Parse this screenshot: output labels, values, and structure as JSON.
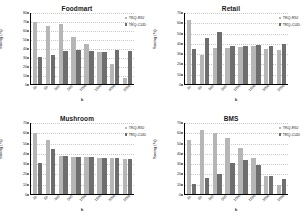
{
  "figure": {
    "series_names": [
      "TKQ-RIU",
      "TKQ-CUD"
    ],
    "colors": {
      "series1": "#b6b6b6",
      "series2": "#6e6e6e"
    },
    "xlabel": "k",
    "ylabel": "Saving (%)"
  },
  "chart_data": [
    {
      "type": "bar",
      "title": "Foodmart",
      "xlabel": "k",
      "ylabel": "Saving (%)",
      "categories": [
        "10",
        "50",
        "100",
        "500",
        "1000",
        "1500",
        "3000",
        "5000"
      ],
      "ylim": [
        0,
        80
      ],
      "yticks": [
        0,
        10,
        20,
        30,
        40,
        50,
        60,
        70,
        80
      ],
      "grid": true,
      "legend_position": "top-right",
      "series": [
        {
          "name": "TKQ-RIU",
          "values": [
            69,
            64,
            67,
            52,
            44,
            36,
            22,
            7
          ]
        },
        {
          "name": "TKQ-CUD",
          "values": [
            30,
            32,
            37,
            38,
            37,
            36,
            38,
            37
          ]
        }
      ]
    },
    {
      "type": "bar",
      "title": "Retail",
      "xlabel": "k",
      "ylabel": "Saving (%)",
      "categories": [
        "10",
        "50",
        "100",
        "500",
        "1000",
        "1500",
        "3000",
        "5000"
      ],
      "ylim": [
        0,
        70
      ],
      "yticks": [
        0,
        10,
        20,
        30,
        40,
        50,
        60,
        70
      ],
      "grid": true,
      "legend_position": "top-right",
      "series": [
        {
          "name": "TKQ-RIU",
          "values": [
            62,
            28,
            35,
            35,
            36,
            37,
            34,
            33
          ]
        },
        {
          "name": "TKQ-CUD",
          "values": [
            34,
            45,
            51,
            37,
            37,
            38,
            37,
            39
          ]
        }
      ]
    },
    {
      "type": "bar",
      "title": "Mushroom",
      "xlabel": "k",
      "ylabel": "Saving (%)",
      "categories": [
        "10",
        "50",
        "100",
        "500",
        "1000",
        "1500",
        "3000",
        "5000"
      ],
      "ylim": [
        0,
        70
      ],
      "yticks": [
        0,
        10,
        20,
        30,
        40,
        50,
        60,
        70
      ],
      "grid": true,
      "legend_position": "top-right",
      "series": [
        {
          "name": "TKQ-RIU",
          "values": [
            59,
            53,
            37,
            36,
            36,
            35,
            35,
            34
          ]
        },
        {
          "name": "TKQ-CUD",
          "values": [
            30,
            44,
            37,
            36,
            36,
            35,
            35,
            34
          ]
        }
      ]
    },
    {
      "type": "bar",
      "title": "BMS",
      "xlabel": "k",
      "ylabel": "Saving (%)",
      "categories": [
        "10",
        "50",
        "100",
        "500",
        "1000",
        "1500",
        "3000",
        "5000"
      ],
      "ylim": [
        0,
        70
      ],
      "yticks": [
        0,
        10,
        20,
        30,
        40,
        50,
        60,
        70
      ],
      "grid": true,
      "legend_position": "top-right",
      "series": [
        {
          "name": "TKQ-RIU",
          "values": [
            53,
            62,
            59,
            54,
            45,
            35,
            18,
            9
          ]
        },
        {
          "name": "TKQ-CUD",
          "values": [
            10,
            16,
            19,
            30,
            33,
            28,
            18,
            15
          ]
        }
      ]
    }
  ]
}
